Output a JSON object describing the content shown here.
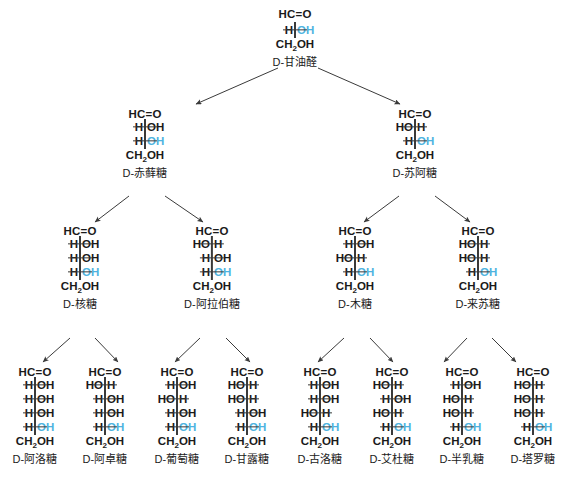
{
  "diagram": {
    "accent_blue": "#4eb3e0",
    "line_color": "#3a3a3a",
    "background": "#ffffff",
    "top_group": "HC=O",
    "bottom_group": "CH2OH",
    "h_text": "H",
    "oh_text": "OH",
    "ho_text": "HO"
  },
  "molecules": [
    {
      "id": "d-glyceraldehyde",
      "label": "D-甘油醛",
      "carbons": 3,
      "x": 295,
      "y": 8,
      "top": "HC=O",
      "bottom": "CH2OH",
      "centers": [
        {
          "left": "H",
          "right": "OH",
          "blue": true
        }
      ]
    },
    {
      "id": "d-erythrose",
      "label": "D-赤藓糖",
      "carbons": 4,
      "x": 145,
      "y": 108,
      "top": "HC=O",
      "bottom": "CH2OH",
      "centers": [
        {
          "left": "H",
          "right": "OH",
          "blue": false
        },
        {
          "left": "H",
          "right": "OH",
          "blue": true
        }
      ]
    },
    {
      "id": "d-threose",
      "label": "D-苏阿糖",
      "carbons": 4,
      "x": 415,
      "y": 108,
      "top": "HC=O",
      "bottom": "CH2OH",
      "centers": [
        {
          "left": "HO",
          "right": "H",
          "blue": false
        },
        {
          "left": "H",
          "right": "OH",
          "blue": true
        }
      ]
    },
    {
      "id": "d-ribose",
      "label": "D-核糖",
      "carbons": 5,
      "x": 80,
      "y": 225,
      "top": "HC=O",
      "bottom": "CH2OH",
      "centers": [
        {
          "left": "H",
          "right": "OH",
          "blue": false
        },
        {
          "left": "H",
          "right": "OH",
          "blue": false
        },
        {
          "left": "H",
          "right": "OH",
          "blue": true
        }
      ]
    },
    {
      "id": "d-arabinose",
      "label": "D-阿拉伯糖",
      "carbons": 5,
      "x": 212,
      "y": 225,
      "top": "HC=O",
      "bottom": "CH2OH",
      "centers": [
        {
          "left": "HO",
          "right": "H",
          "blue": false
        },
        {
          "left": "H",
          "right": "OH",
          "blue": false
        },
        {
          "left": "H",
          "right": "OH",
          "blue": true
        }
      ]
    },
    {
      "id": "d-xylose",
      "label": "D-木糖",
      "carbons": 5,
      "x": 355,
      "y": 225,
      "top": "HC=O",
      "bottom": "CH2OH",
      "centers": [
        {
          "left": "H",
          "right": "OH",
          "blue": false
        },
        {
          "left": "HO",
          "right": "H",
          "blue": false
        },
        {
          "left": "H",
          "right": "OH",
          "blue": true
        }
      ]
    },
    {
      "id": "d-lyxose",
      "label": "D-来苏糖",
      "carbons": 5,
      "x": 478,
      "y": 225,
      "top": "HC=O",
      "bottom": "CH2OH",
      "centers": [
        {
          "left": "HO",
          "right": "H",
          "blue": false
        },
        {
          "left": "HO",
          "right": "H",
          "blue": false
        },
        {
          "left": "H",
          "right": "OH",
          "blue": true
        }
      ]
    },
    {
      "id": "d-allose",
      "label": "D-阿洛糖",
      "carbons": 6,
      "x": 35,
      "y": 366,
      "top": "HC=O",
      "bottom": "CH2OH",
      "centers": [
        {
          "left": "H",
          "right": "OH",
          "blue": false
        },
        {
          "left": "H",
          "right": "OH",
          "blue": false
        },
        {
          "left": "H",
          "right": "OH",
          "blue": false
        },
        {
          "left": "H",
          "right": "OH",
          "blue": true
        }
      ]
    },
    {
      "id": "d-altrose",
      "label": "D-阿卓糖",
      "carbons": 6,
      "x": 105,
      "y": 366,
      "top": "HC=O",
      "bottom": "CH2OH",
      "centers": [
        {
          "left": "HO",
          "right": "H",
          "blue": false
        },
        {
          "left": "H",
          "right": "OH",
          "blue": false
        },
        {
          "left": "H",
          "right": "OH",
          "blue": false
        },
        {
          "left": "H",
          "right": "OH",
          "blue": true
        }
      ]
    },
    {
      "id": "d-glucose",
      "label": "D-葡萄糖",
      "carbons": 6,
      "x": 177,
      "y": 366,
      "top": "HC=O",
      "bottom": "CH2OH",
      "centers": [
        {
          "left": "H",
          "right": "OH",
          "blue": false
        },
        {
          "left": "HO",
          "right": "H",
          "blue": false
        },
        {
          "left": "H",
          "right": "OH",
          "blue": false
        },
        {
          "left": "H",
          "right": "OH",
          "blue": true
        }
      ]
    },
    {
      "id": "d-mannose",
      "label": "D-甘露糖",
      "carbons": 6,
      "x": 247,
      "y": 366,
      "top": "HC=O",
      "bottom": "CH2OH",
      "centers": [
        {
          "left": "HO",
          "right": "H",
          "blue": false
        },
        {
          "left": "HO",
          "right": "H",
          "blue": false
        },
        {
          "left": "H",
          "right": "OH",
          "blue": false
        },
        {
          "left": "H",
          "right": "OH",
          "blue": true
        }
      ]
    },
    {
      "id": "d-gulose",
      "label": "D-古洛糖",
      "carbons": 6,
      "x": 320,
      "y": 366,
      "top": "HC=O",
      "bottom": "CH2OH",
      "centers": [
        {
          "left": "H",
          "right": "OH",
          "blue": false
        },
        {
          "left": "H",
          "right": "OH",
          "blue": false
        },
        {
          "left": "HO",
          "right": "H",
          "blue": false
        },
        {
          "left": "H",
          "right": "OH",
          "blue": true
        }
      ]
    },
    {
      "id": "d-idose",
      "label": "D-艾杜糖",
      "carbons": 6,
      "x": 392,
      "y": 366,
      "top": "HC=O",
      "bottom": "CH2OH",
      "centers": [
        {
          "left": "HO",
          "right": "H",
          "blue": false
        },
        {
          "left": "H",
          "right": "OH",
          "blue": false
        },
        {
          "left": "HO",
          "right": "H",
          "blue": false
        },
        {
          "left": "H",
          "right": "OH",
          "blue": true
        }
      ]
    },
    {
      "id": "d-galactose",
      "label": "D-半乳糖",
      "carbons": 6,
      "x": 462,
      "y": 366,
      "top": "HC=O",
      "bottom": "CH2OH",
      "centers": [
        {
          "left": "H",
          "right": "OH",
          "blue": false
        },
        {
          "left": "HO",
          "right": "H",
          "blue": false
        },
        {
          "left": "HO",
          "right": "H",
          "blue": false
        },
        {
          "left": "H",
          "right": "OH",
          "blue": true
        }
      ]
    },
    {
      "id": "d-talose",
      "label": "D-塔罗糖",
      "carbons": 6,
      "x": 533,
      "y": 366,
      "top": "HC=O",
      "bottom": "CH2OH",
      "centers": [
        {
          "left": "HO",
          "right": "H",
          "blue": false
        },
        {
          "left": "HO",
          "right": "H",
          "blue": false
        },
        {
          "left": "HO",
          "right": "H",
          "blue": false
        },
        {
          "left": "H",
          "right": "OH",
          "blue": true
        }
      ]
    }
  ],
  "arrows": [
    {
      "from": "d-glyceraldehyde",
      "to": "d-erythrose",
      "x1": 278,
      "y1": 68,
      "x2": 196,
      "y2": 104
    },
    {
      "from": "d-glyceraldehyde",
      "to": "d-threose",
      "x1": 318,
      "y1": 68,
      "x2": 400,
      "y2": 104
    },
    {
      "from": "d-erythrose",
      "to": "d-ribose",
      "x1": 129,
      "y1": 196,
      "x2": 95,
      "y2": 222
    },
    {
      "from": "d-erythrose",
      "to": "d-arabinose",
      "x1": 165,
      "y1": 196,
      "x2": 203,
      "y2": 222
    },
    {
      "from": "d-threose",
      "to": "d-xylose",
      "x1": 399,
      "y1": 196,
      "x2": 364,
      "y2": 222
    },
    {
      "from": "d-threose",
      "to": "d-lyxose",
      "x1": 435,
      "y1": 196,
      "x2": 470,
      "y2": 222
    },
    {
      "from": "d-ribose",
      "to": "d-allose",
      "x1": 70,
      "y1": 338,
      "x2": 43,
      "y2": 362
    },
    {
      "from": "d-ribose",
      "to": "d-altrose",
      "x1": 95,
      "y1": 338,
      "x2": 118,
      "y2": 362
    },
    {
      "from": "d-arabinose",
      "to": "d-glucose",
      "x1": 200,
      "y1": 338,
      "x2": 175,
      "y2": 362
    },
    {
      "from": "d-arabinose",
      "to": "d-mannose",
      "x1": 226,
      "y1": 338,
      "x2": 250,
      "y2": 362
    },
    {
      "from": "d-xylose",
      "to": "d-gulose",
      "x1": 344,
      "y1": 338,
      "x2": 318,
      "y2": 362
    },
    {
      "from": "d-xylose",
      "to": "d-idose",
      "x1": 370,
      "y1": 338,
      "x2": 393,
      "y2": 362
    },
    {
      "from": "d-lyxose",
      "to": "d-galactose",
      "x1": 467,
      "y1": 338,
      "x2": 444,
      "y2": 362
    },
    {
      "from": "d-lyxose",
      "to": "d-talose",
      "x1": 492,
      "y1": 338,
      "x2": 516,
      "y2": 362
    }
  ]
}
